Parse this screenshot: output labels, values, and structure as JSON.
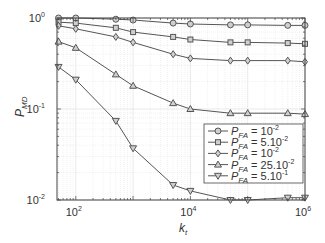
{
  "chart_data": {
    "type": "line",
    "title": "",
    "xlabel": "k_t",
    "ylabel": "P_MD",
    "xscale": "log",
    "yscale": "log",
    "xlim": [
      47,
      1000000
    ],
    "ylim": [
      0.01,
      1
    ],
    "grid": true,
    "legend_position": "lower right",
    "x_ticks": [
      {
        "value": 100,
        "base": "10",
        "exp": "2"
      },
      {
        "value": 10000,
        "base": "10",
        "exp": "4"
      },
      {
        "value": 1000000,
        "base": "10",
        "exp": "6"
      }
    ],
    "y_ticks": [
      {
        "value": 1,
        "base": "10",
        "exp": "0"
      },
      {
        "value": 0.1,
        "base": "10",
        "exp": "-1"
      },
      {
        "value": 0.01,
        "base": "10",
        "exp": "-2"
      }
    ],
    "x": [
      50,
      100,
      500,
      1000,
      5000,
      10000,
      50000,
      100000,
      500000,
      1000000
    ],
    "series": [
      {
        "name": "P_FA = 10^-2",
        "label_main": "P",
        "label_sub": "FA",
        "label_rest": " = 10",
        "label_exp": "-2",
        "marker": "circle",
        "values": [
          1.0,
          1.0,
          0.97,
          0.95,
          0.88,
          0.86,
          0.84,
          0.84,
          0.83,
          0.83
        ]
      },
      {
        "name": "P_FA = 5.10^-2",
        "label_main": "P",
        "label_sub": "FA",
        "label_rest": " = 5.10",
        "label_exp": "-2",
        "marker": "square",
        "values": [
          0.9,
          0.88,
          0.78,
          0.7,
          0.62,
          0.58,
          0.54,
          0.54,
          0.53,
          0.52
        ]
      },
      {
        "name": "P_FA = 10^-2",
        "label_main": "P",
        "label_sub": "FA",
        "label_rest": " = 10",
        "label_exp": "-2",
        "marker": "diamond",
        "values": [
          0.82,
          0.76,
          0.62,
          0.54,
          0.4,
          0.36,
          0.34,
          0.34,
          0.34,
          0.33
        ]
      },
      {
        "name": "P_FA = 25.10^-2",
        "label_main": "P",
        "label_sub": "FA",
        "label_rest": " = 25.10",
        "label_exp": "-2",
        "marker": "triangle-up",
        "values": [
          0.55,
          0.47,
          0.24,
          0.18,
          0.116,
          0.1,
          0.09,
          0.09,
          0.09,
          0.088
        ]
      },
      {
        "name": "P_FA = 5.10^-1",
        "label_main": "P",
        "label_sub": "FA",
        "label_rest": " = 5.10",
        "label_exp": "-1",
        "marker": "triangle-down",
        "values": [
          0.29,
          0.21,
          0.074,
          0.037,
          0.0146,
          0.0126,
          0.01,
          0.01,
          0.0106,
          0.0106
        ]
      }
    ]
  },
  "style": {
    "line_color": "#555555",
    "marker_fill": "#cfcfcf",
    "grid_color": "#e3e3e3",
    "axis_color": "#444444"
  }
}
